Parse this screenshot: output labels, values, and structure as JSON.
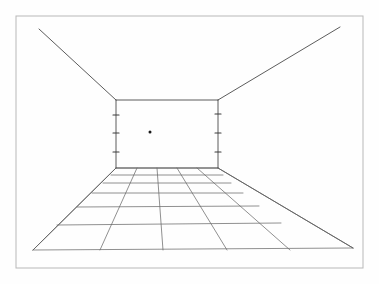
{
  "drawing": {
    "title": "One-Point Perspective Room Interior",
    "medium": "pencil line drawing on paper",
    "background_color": "#ffffff",
    "paper_tone": "#fefefe",
    "line_color": "#4a4a4a",
    "grid_line_color": "#6b6b6b",
    "frame_color": "#b8b8b8",
    "vanishing_point_color": "#1a1a1a"
  },
  "frame": {
    "label": "image border frame",
    "x": 16,
    "y": 16,
    "width": 347,
    "height": 252
  },
  "vanishing_point": {
    "label": "vanishing point",
    "cx": 150,
    "cy": 132,
    "r": 1.5
  },
  "back_wall": {
    "label": "back wall rectangle",
    "left": 116,
    "right": 218,
    "top": 100,
    "bottom": 168,
    "edges": {
      "top_edge": "M 116 100 L 218 100",
      "bottom_edge": "M 116 168 L 218 168",
      "left_edge": "M 116 100 L 116 168",
      "right_edge": "M 218 100 L 218 168"
    }
  },
  "ceiling": {
    "label": "ceiling receding edges",
    "left_diagonal": "M 39 29 L 116 100",
    "right_diagonal": "M 218 100 L 340 27"
  },
  "floor_outline": {
    "label": "floor receding side edges",
    "left_diagonal": "M 33 250 L 116 168",
    "right_diagonal": "M 218 168 L 353 248",
    "front_edge": "M 33 250 L 353 248"
  },
  "floor_grid": {
    "label": "floor tile grid",
    "receding_lines_count": 6,
    "transverse_lines_count": 7,
    "receding_lines": [
      "M 33 250 L 116 168",
      "M 100 250 L 137 168",
      "M 163 250 L 157 168",
      "M 227 250 L 177 168",
      "M 290 250 L 197 168",
      "M 353 248 L 218 168"
    ],
    "transverse_lines": [
      "M 116 168 L 218 168",
      "M 111 175 L 223 175",
      "M 103 183 L 231 183",
      "M 92 193 L 243 193",
      "M 77 207 L 259 206",
      "M 57 225 L 281 223",
      "M 33 250 L 353 248"
    ]
  },
  "wall_ticks": {
    "label": "measurement tick marks on corner verticals",
    "left": [
      {
        "name": "left-tick-1",
        "path": "M 113 115 L 119 115"
      },
      {
        "name": "left-tick-2",
        "path": "M 113 133 L 119 133"
      },
      {
        "name": "left-tick-3",
        "path": "M 113 152 L 119 152"
      }
    ],
    "right": [
      {
        "name": "right-tick-1",
        "path": "M 215 114 L 221 114"
      },
      {
        "name": "right-tick-2",
        "path": "M 215 133 L 221 133"
      },
      {
        "name": "right-tick-3",
        "path": "M 215 152 L 221 152"
      }
    ]
  }
}
